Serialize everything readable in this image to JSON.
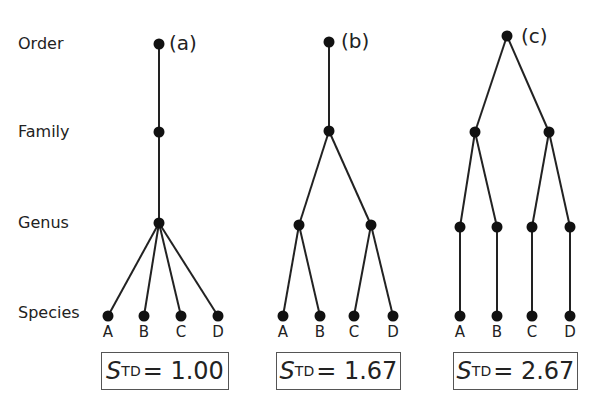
{
  "ranks": [
    "Order",
    "Family",
    "Genus",
    "Species"
  ],
  "panels": [
    {
      "id": "a",
      "label": "(a)",
      "species": [
        "A",
        "B",
        "C",
        "D"
      ],
      "std_symbol": "S",
      "std_subscript": "TD",
      "std_equals": "=",
      "std_value": "1.00"
    },
    {
      "id": "b",
      "label": "(b)",
      "species": [
        "A",
        "B",
        "C",
        "D"
      ],
      "std_symbol": "S",
      "std_subscript": "TD",
      "std_equals": "=",
      "std_value": "1.67"
    },
    {
      "id": "c",
      "label": "(c)",
      "species": [
        "A",
        "B",
        "C",
        "D"
      ],
      "std_symbol": "S",
      "std_subscript": "TD",
      "std_equals": "=",
      "std_value": "2.67"
    }
  ],
  "colors": {
    "line": "#222222",
    "node": "#111111",
    "box_border": "#555555"
  }
}
